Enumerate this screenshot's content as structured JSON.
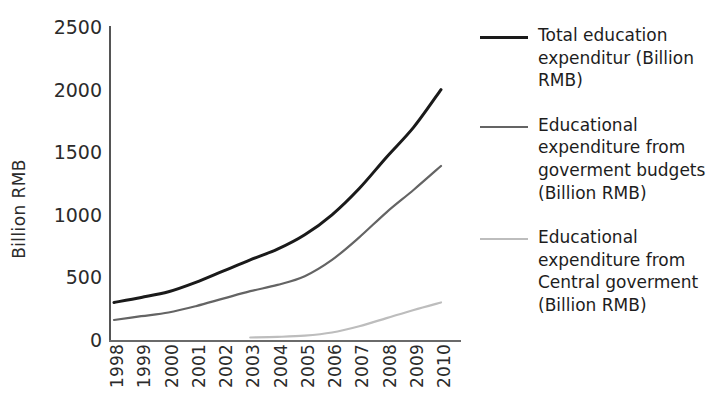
{
  "chart_data": {
    "type": "line",
    "title": "",
    "xlabel": "",
    "ylabel": "Billion RMB",
    "categories": [
      "1998",
      "1999",
      "2000",
      "2001",
      "2002",
      "2003",
      "2004",
      "2005",
      "2006",
      "2007",
      "2008",
      "2009",
      "2010"
    ],
    "x": [
      1998,
      1999,
      2000,
      2001,
      2002,
      2003,
      2004,
      2005,
      2006,
      2007,
      2008,
      2009,
      2010
    ],
    "ylim": [
      0,
      2500
    ],
    "yticks": [
      0,
      500,
      1000,
      1500,
      2000,
      2500
    ],
    "grid": false,
    "legend_position": "right",
    "series": [
      {
        "name": "Total education expenditur (Billion RMB)",
        "color": "#1a1a1a",
        "width": 3,
        "values": [
          300,
          340,
          385,
          460,
          550,
          640,
          725,
          840,
          1000,
          1210,
          1460,
          1700,
          2000
        ]
      },
      {
        "name": "Educational expenditure from goverment budgets (Billion RMB)",
        "color": "#646464",
        "width": 2.2,
        "values": [
          160,
          190,
          220,
          270,
          330,
          390,
          440,
          510,
          640,
          820,
          1020,
          1200,
          1390
        ]
      },
      {
        "name": "Educational expenditure from Central goverment (Billion RMB)",
        "color": "#bdbdbd",
        "width": 2.2,
        "values": [
          null,
          null,
          null,
          null,
          null,
          20,
          25,
          35,
          60,
          110,
          175,
          240,
          300
        ]
      }
    ]
  },
  "axes": {
    "y_title": "Billion RMB",
    "y_tick_labels": [
      "2500",
      "2000",
      "1500",
      "1000",
      "500",
      "0"
    ],
    "x_tick_labels": [
      "1998",
      "1999",
      "2000",
      "2001",
      "2002",
      "2003",
      "2004",
      "2005",
      "2006",
      "2007",
      "2008",
      "2009",
      "2010"
    ]
  },
  "legend": {
    "entries": [
      {
        "label": "Total education expenditur (Billion RMB)",
        "color": "#1a1a1a",
        "thickness": "3px"
      },
      {
        "label": "Educational expenditure from goverment budgets (Billion RMB)",
        "color": "#646464",
        "thickness": "2px"
      },
      {
        "label": "Educational expenditure from Central goverment (Billion RMB)",
        "color": "#bdbdbd",
        "thickness": "2px"
      }
    ]
  }
}
